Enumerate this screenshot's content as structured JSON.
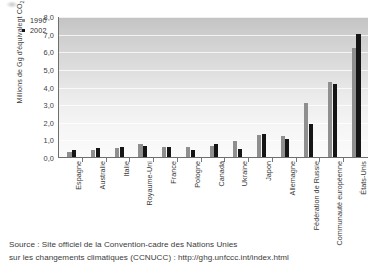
{
  "chart_data": {
    "type": "bar",
    "title": "",
    "xlabel": "",
    "ylabel": "Millions de Gg d'équivalent CO2",
    "ylabel_base": "Millions de Gg d'équivalent CO",
    "ylabel_sub": "2",
    "ylim": [
      0,
      8
    ],
    "yticks": [
      "0,0",
      "1,0",
      "2,0",
      "3,0",
      "4,0",
      "5,0",
      "6,0",
      "7,0",
      "8,0"
    ],
    "ytick_values": [
      0,
      1,
      2,
      3,
      4,
      5,
      6,
      7,
      8
    ],
    "grid": true,
    "legend_position": "top-left",
    "categories": [
      "Espagne",
      "Australie",
      "Italie",
      "Royaume-Uni",
      "France",
      "Pologne",
      "Canada",
      "Ukraine",
      "Japon",
      "Allemagne",
      "Fédération de Russie",
      "Communauté européenne",
      "États-Unis"
    ],
    "series": [
      {
        "name": "1990",
        "color": "#8f8f8f",
        "values": [
          0.29,
          0.42,
          0.51,
          0.75,
          0.56,
          0.56,
          0.61,
          0.93,
          1.27,
          1.22,
          3.05,
          4.25,
          6.2
        ]
      },
      {
        "name": "2002",
        "color": "#151515",
        "values": [
          0.4,
          0.49,
          0.55,
          0.65,
          0.55,
          0.39,
          0.73,
          0.44,
          1.33,
          1.02,
          1.88,
          4.14,
          6.98
        ]
      }
    ]
  },
  "legend": {
    "items": [
      {
        "label": "1990",
        "color": "#8f8f8f"
      },
      {
        "label": "2002",
        "color": "#151515"
      }
    ]
  },
  "source": {
    "line1": "Source : Site officiel de la Convention-cadre des Nations Unies",
    "line2": "sur les changements climatiques (CCNUCC) : http://ghg.unfccc.int/index.html"
  }
}
